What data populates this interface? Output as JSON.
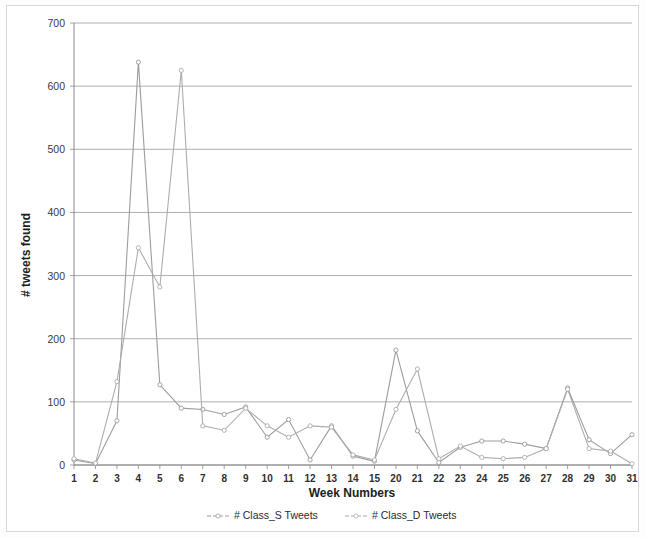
{
  "figure": {
    "border_color": "#d8d8d8",
    "background": "#ffffff"
  },
  "chart_data": {
    "type": "line",
    "title": "",
    "xlabel": "Week Numbers",
    "ylabel": "# tweets found",
    "xlim": [
      1,
      31
    ],
    "ylim": [
      0,
      700
    ],
    "ytick_values": [
      0,
      100,
      200,
      300,
      400,
      500,
      600,
      700
    ],
    "ytick_labels": [
      "0",
      "100",
      "200",
      "300",
      "400",
      "500",
      "600",
      "700"
    ],
    "xtick_labels": [
      "1",
      "2",
      "3",
      "4",
      "5",
      "6",
      "7",
      "8",
      "9",
      "10",
      "11",
      "12",
      "13",
      "14",
      "15",
      "20",
      "21",
      "22",
      "23",
      "24",
      "25",
      "26",
      "27",
      "28",
      "29",
      "30",
      "31"
    ],
    "x": [
      1,
      2,
      3,
      4,
      5,
      6,
      7,
      8,
      9,
      10,
      11,
      12,
      13,
      14,
      15,
      16,
      17,
      18,
      19,
      20,
      21,
      22,
      23,
      24,
      25,
      26,
      27
    ],
    "grid": "horizontal",
    "legend_position": "bottom",
    "marker": "open-circle",
    "series": [
      {
        "name": "# Class_S Tweets",
        "color": "#9d9d9d",
        "values": [
          8,
          2,
          70,
          638,
          127,
          90,
          88,
          80,
          92,
          44,
          72,
          8,
          62,
          14,
          6,
          182,
          54,
          4,
          28,
          38,
          38,
          33,
          26,
          122,
          40,
          18,
          48
        ]
      },
      {
        "name": "# Class_D Tweets",
        "color": "#adadad",
        "values": [
          10,
          3,
          132,
          344,
          282,
          625,
          62,
          55,
          90,
          62,
          44,
          62,
          60,
          16,
          8,
          88,
          152,
          10,
          30,
          12,
          10,
          12,
          26,
          120,
          26,
          22,
          2
        ]
      }
    ]
  },
  "legend": {
    "entries": [
      {
        "label": "# Class_S Tweets",
        "color": "#9d9d9d"
      },
      {
        "label": "# Class_D Tweets",
        "color": "#adadad"
      }
    ]
  }
}
